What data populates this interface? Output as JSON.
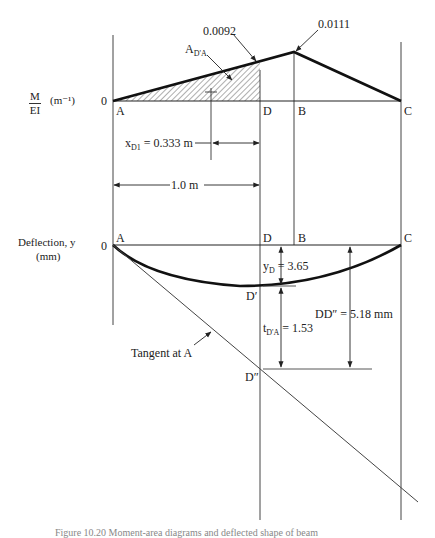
{
  "diagram": {
    "moment_diagram": {
      "axis_label_num": "M",
      "axis_label_den": "EI",
      "axis_unit": "(m⁻¹)",
      "zero": "0",
      "points": {
        "A": "A",
        "D": "D",
        "B": "B",
        "C": "C"
      },
      "value_at_D": "0.0092",
      "value_at_B": "0.0111",
      "area_label_main": "A",
      "area_label_sub": "D'A",
      "centroid_label_main": "x",
      "centroid_label_sub": "D1",
      "centroid_value": "= 0.333 m",
      "span_label": "1.0 m"
    },
    "deflection_diagram": {
      "axis_label_line1": "Deflection, y",
      "axis_label_line2": "(mm)",
      "zero": "0",
      "points": {
        "A": "A",
        "D": "D",
        "B": "B",
        "C": "C",
        "D_prime": "D′",
        "D_double_prime": "D″"
      },
      "yD_main": "y",
      "yD_sub": "D",
      "yD_value": "= 3.65",
      "t_main": "t",
      "t_sub": "D'A",
      "t_value": "= 1.53",
      "DD_label": "DD″ = 5.18 mm",
      "tangent_label": "Tangent at A"
    },
    "caption": "Figure 10.20  Moment-area diagrams and deflected shape of beam"
  }
}
